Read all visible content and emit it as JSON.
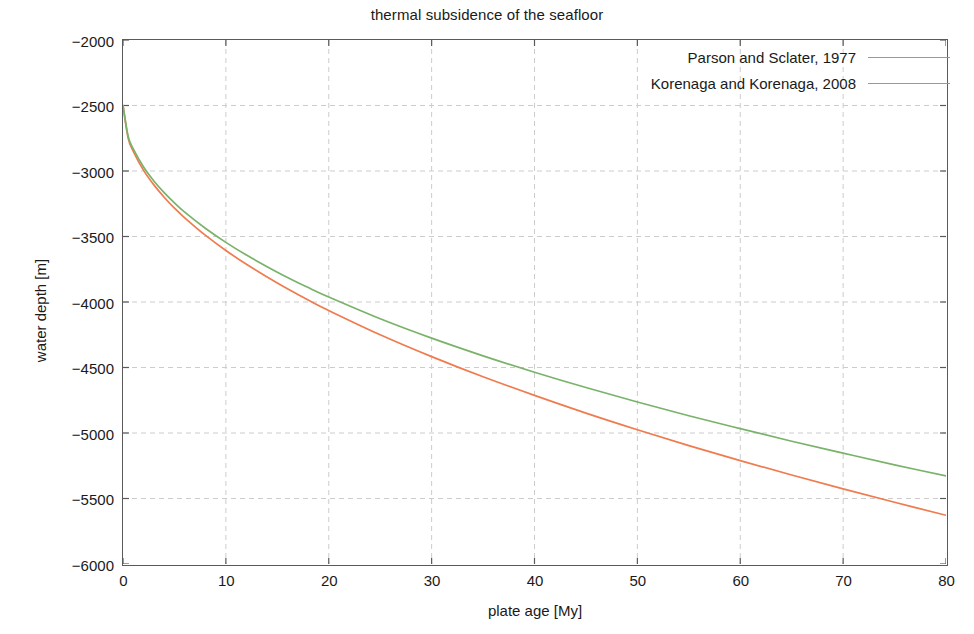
{
  "chart_data": {
    "type": "line",
    "title": "thermal subsidence of the seafloor",
    "xlabel": "plate age [My]",
    "ylabel": "water depth [m]",
    "xlim": [
      0,
      80
    ],
    "ylim": [
      -6000,
      -2000
    ],
    "xticks": [
      0,
      10,
      20,
      30,
      40,
      50,
      60,
      70,
      80
    ],
    "yticks": [
      -6000,
      -5500,
      -5000,
      -4500,
      -4000,
      -3500,
      -3000,
      -2500,
      -2000
    ],
    "xticklabels": [
      "0",
      "10",
      "20",
      "30",
      "40",
      "50",
      "60",
      "70",
      "80"
    ],
    "yticklabels": [
      "-6000",
      "-5500",
      "-5000",
      "-4500",
      "-4000",
      "-3500",
      "-3000",
      "-2500",
      "-2000"
    ],
    "grid": true,
    "grid_style": "dashed",
    "grid_color": "#cccccc",
    "legend_position": "upper right",
    "legend_frame": false,
    "x": [
      0,
      0.5,
      1,
      2,
      3,
      4,
      5,
      6,
      8,
      10,
      12,
      15,
      18,
      20,
      25,
      30,
      35,
      40,
      45,
      50,
      55,
      60,
      65,
      70,
      75,
      80
    ],
    "series": [
      {
        "name": "Parson and Sclater, 1977",
        "color": "#ef7b4e",
        "values": [
          -2500,
          -2748,
          -2850,
          -2995,
          -3106,
          -3200,
          -3283,
          -3357,
          -3490,
          -3607,
          -3712,
          -3855,
          -3985,
          -4065,
          -4250,
          -4417,
          -4571,
          -4713,
          -4848,
          -4975,
          -5096,
          -5211,
          -5321,
          -5427,
          -5529,
          -5628
        ]
      },
      {
        "name": "Korenaga and Korenaga, 2008",
        "color": "#79b36a",
        "values": [
          -2500,
          -2735,
          -2832,
          -2970,
          -3076,
          -3165,
          -3243,
          -3314,
          -3437,
          -3545,
          -3642,
          -3772,
          -3890,
          -3962,
          -4128,
          -4276,
          -4411,
          -4536,
          -4653,
          -4763,
          -4868,
          -4967,
          -5063,
          -5154,
          -5243,
          -5328
        ]
      }
    ]
  },
  "axes": {
    "axis_color": "#5a5a5a",
    "background": "#ffffff"
  }
}
